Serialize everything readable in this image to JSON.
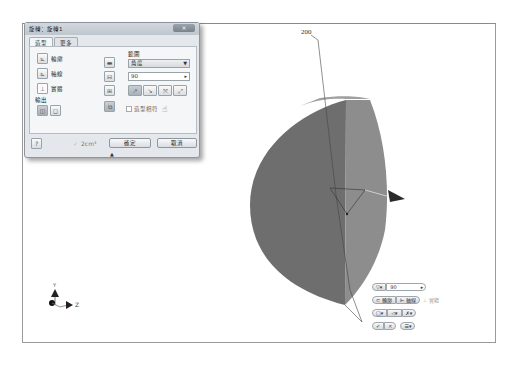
{
  "viewport": {
    "dimension_label": "200",
    "triad": {
      "y_label": "Y",
      "z_label": "Z"
    },
    "colors": {
      "left_face": "#6e6e6e",
      "right_face": "#8c8c8c",
      "top_face": "#9a9a9a",
      "frame": "#9a9a9a"
    }
  },
  "dialog": {
    "title": "旋轉：旋轉1",
    "close_label": "×",
    "tabs": [
      {
        "label": "造型",
        "active": true
      },
      {
        "label": "更多",
        "active": false
      }
    ],
    "inputs": [
      {
        "label": "輪廓",
        "icon": "profile-icon"
      },
      {
        "label": "軸線",
        "icon": "axis-icon"
      },
      {
        "label": "實體",
        "icon": "solid-icon"
      }
    ],
    "output_label": "輸出",
    "output_buttons": [
      {
        "icon": "solid-output-icon",
        "pressed": true
      },
      {
        "icon": "surface-output-icon",
        "pressed": false
      }
    ],
    "operation_buttons": [
      {
        "icon": "join-icon",
        "pressed": false
      },
      {
        "icon": "cut-icon",
        "pressed": false
      },
      {
        "icon": "intersect-icon",
        "pressed": false
      },
      {
        "icon": "new-solid-icon",
        "pressed": true
      }
    ],
    "extents": {
      "label": "範圍",
      "type": "角度",
      "value": "90",
      "direction_buttons": [
        "direction-1-icon",
        "direction-2-icon",
        "symmetric-icon",
        "asymmetric-icon"
      ]
    },
    "match_shape_label": "造型相符",
    "match_shape_checked": false,
    "help_icon": "help-icon",
    "volume_text": "2cm³",
    "ok_label": "確定",
    "cancel_label": "取消",
    "expander": "▲"
  },
  "mini_toolbar": {
    "extent_type": "▽▾",
    "value": "90",
    "value_arrow": "▸",
    "profile_label": "輪廓",
    "axis_label": "軸線",
    "solid_label": "實體",
    "row3": [
      "□▾",
      "◁▾",
      "✗▾"
    ],
    "ok_glyph": "✔",
    "cancel_glyph": "✕",
    "menu_glyph": "☰▾"
  }
}
